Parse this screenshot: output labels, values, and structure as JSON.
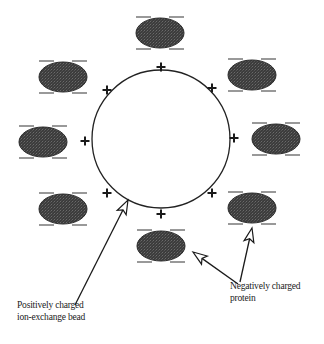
{
  "diagram": {
    "type": "ion-exchange illustration",
    "bead": {
      "cx": 161,
      "cy": 139,
      "r": 69,
      "stroke": "#222222",
      "fill": "#ffffff"
    },
    "plus_charges": [
      {
        "x": 161,
        "y": 67,
        "symbol": "+"
      },
      {
        "x": 107,
        "y": 90,
        "symbol": "+"
      },
      {
        "x": 212,
        "y": 88,
        "symbol": "+"
      },
      {
        "x": 85,
        "y": 141,
        "symbol": "+"
      },
      {
        "x": 234,
        "y": 138,
        "symbol": "+"
      },
      {
        "x": 107,
        "y": 193,
        "symbol": "+"
      },
      {
        "x": 212,
        "y": 193,
        "symbol": "+"
      },
      {
        "x": 161,
        "y": 214,
        "symbol": "+"
      }
    ],
    "proteins": [
      {
        "cx": 160,
        "cy": 33
      },
      {
        "cx": 63,
        "cy": 77
      },
      {
        "cx": 252,
        "cy": 75
      },
      {
        "cx": 43,
        "cy": 142
      },
      {
        "cx": 276,
        "cy": 139
      },
      {
        "cx": 63,
        "cy": 209
      },
      {
        "cx": 252,
        "cy": 208
      },
      {
        "cx": 161,
        "cy": 246
      }
    ],
    "protein_style": {
      "rx": 24,
      "ry": 15,
      "fill": "#3a3a3a",
      "dash_color": "#555555"
    },
    "arrows": [
      {
        "x1": 75,
        "y1": 305,
        "x2": 128,
        "y2": 200
      },
      {
        "x1": 238,
        "y1": 284,
        "x2": 193,
        "y2": 252
      },
      {
        "x1": 240,
        "y1": 282,
        "x2": 252,
        "y2": 228
      }
    ],
    "labels": {
      "bead_line1": "Positively charged",
      "bead_line2": "ion-exchange bead",
      "protein_line1": "Negatively charged",
      "protein_line2": "protein"
    }
  }
}
